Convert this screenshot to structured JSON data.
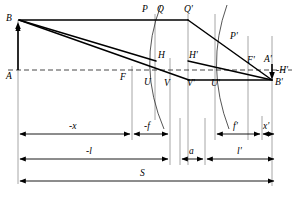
{
  "diagram": {
    "type": "optical-ray-diagram",
    "width": 297,
    "height": 197,
    "colors": {
      "ink": "#000000",
      "guide": "#8a8a8a",
      "axis": "#4d4d4d",
      "background": "#ffffff"
    },
    "axis": {
      "label": "optical-axis",
      "y": 70,
      "style": "dashed",
      "x_start": 8,
      "x_end": 292
    },
    "points": [
      {
        "id": "B",
        "label": "B",
        "x": 18,
        "y": 20,
        "lx": 6,
        "ly": 14
      },
      {
        "id": "A",
        "label": "A",
        "x": 18,
        "y": 70,
        "lx": 6,
        "ly": 72
      },
      {
        "id": "F",
        "label": "F",
        "x": 132,
        "y": 70,
        "lx": 122,
        "ly": 74
      },
      {
        "id": "P",
        "label": "P",
        "x": 148,
        "y": 20,
        "lx": 143,
        "ly": 7
      },
      {
        "id": "Q",
        "label": "Q",
        "x": 155,
        "y": 20,
        "lx": 158,
        "ly": 7
      },
      {
        "id": "Qp",
        "label": "Q'",
        "x": 188,
        "y": 20,
        "lx": 185,
        "ly": 7
      },
      {
        "id": "H",
        "label": "H",
        "x": 155,
        "y": 61,
        "lx": 157,
        "ly": 52
      },
      {
        "id": "Hp",
        "label": "H'",
        "x": 188,
        "y": 61,
        "lx": 188,
        "ly": 52
      },
      {
        "id": "U",
        "label": "U",
        "x": 152,
        "y": 77,
        "lx": 145,
        "ly": 79
      },
      {
        "id": "V",
        "label": "V",
        "x": 170,
        "y": 80,
        "lx": 165,
        "ly": 80
      },
      {
        "id": "Vp",
        "label": "V'",
        "x": 188,
        "y": 80,
        "lx": 188,
        "ly": 80
      },
      {
        "id": "Up",
        "label": "U'",
        "x": 215,
        "y": 80,
        "lx": 212,
        "ly": 80
      },
      {
        "id": "Pp",
        "label": "P'",
        "x": 228,
        "y": 40,
        "lx": 230,
        "ly": 33
      },
      {
        "id": "Fp",
        "label": "F'",
        "x": 248,
        "y": 70,
        "lx": 249,
        "ly": 58
      },
      {
        "id": "Ap",
        "label": "A'",
        "x": 272,
        "y": 70,
        "lx": 268,
        "ly": 57
      },
      {
        "id": "Bp",
        "label": "B'",
        "x": 272,
        "y": 80,
        "lx": 274,
        "ly": 80
      },
      {
        "id": "mHp",
        "label": "-H'",
        "x": 278,
        "y": 74,
        "lx": 276,
        "ly": 69
      }
    ],
    "dimensions": [
      {
        "id": "neg-x",
        "label": "-x",
        "row": 0,
        "x1": 18,
        "x2": 132,
        "y": 134,
        "lx": 71,
        "ly": 124
      },
      {
        "id": "neg-f",
        "label": "-f",
        "row": 0,
        "x1": 132,
        "x2": 170,
        "y": 134,
        "lx": 146,
        "ly": 124
      },
      {
        "id": "f-prime",
        "label": "f'",
        "row": 0,
        "x1": 215,
        "x2": 262,
        "y": 134,
        "lx": 234,
        "ly": 124
      },
      {
        "id": "x-prime",
        "label": "x'",
        "row": 0,
        "x1": 262,
        "x2": 276,
        "y": 134,
        "lx": 263,
        "ly": 124
      },
      {
        "id": "neg-l",
        "label": "-l",
        "row": 1,
        "x1": 18,
        "x2": 170,
        "y": 159,
        "lx": 88,
        "ly": 149
      },
      {
        "id": "a",
        "label": "a",
        "row": 1,
        "x1": 180,
        "x2": 205,
        "y": 159,
        "lx": 189,
        "ly": 149
      },
      {
        "id": "l-prime",
        "label": "l'",
        "row": 1,
        "x1": 205,
        "x2": 276,
        "y": 159,
        "lx": 238,
        "ly": 149
      },
      {
        "id": "S",
        "label": "S",
        "row": 2,
        "x1": 18,
        "x2": 276,
        "y": 181,
        "lx": 141,
        "ly": 171
      }
    ],
    "guide_lines": [
      {
        "id": "guide-A",
        "x": 18,
        "y1": 20,
        "y2": 184
      },
      {
        "id": "guide-F",
        "x": 132,
        "y1": 66,
        "y2": 140
      },
      {
        "id": "guide-HQ",
        "x": 155,
        "y1": 14,
        "y2": 120
      },
      {
        "id": "guide-V",
        "x": 170,
        "y1": 60,
        "y2": 165
      },
      {
        "id": "guide-HpQ",
        "x": 188,
        "y1": 14,
        "y2": 165
      },
      {
        "id": "guide-Up",
        "x": 215,
        "y1": 14,
        "y2": 140
      },
      {
        "id": "guide-Fp",
        "x": 248,
        "y1": 40,
        "y2": 140
      },
      {
        "id": "guide-Ap",
        "x": 272,
        "y1": 40,
        "y2": 186
      },
      {
        "id": "guide-xp",
        "x": 262,
        "y1": 118,
        "y2": 140
      },
      {
        "id": "guide-a1",
        "x": 180,
        "y1": 120,
        "y2": 165
      },
      {
        "id": "guide-a2",
        "x": 205,
        "y1": 120,
        "y2": 165
      }
    ],
    "rays": [
      {
        "id": "ray-parallel-in",
        "from": "B",
        "to": "P",
        "d": "M 18 20 L 188 20"
      },
      {
        "id": "ray-chief-in",
        "from": "B",
        "to": "H",
        "d": "M 18 20 L 155 61"
      },
      {
        "id": "ray-lower-in",
        "from": "B",
        "to": "V",
        "d": "M 18 20 L 188 80"
      },
      {
        "id": "ray-parallel-out",
        "from": "Qp",
        "to": "Bp",
        "d": "M 188 20 L 272 80"
      },
      {
        "id": "ray-chief-out",
        "from": "Hp",
        "to": "Bp",
        "d": "M 188 61 L 272 80"
      },
      {
        "id": "ray-lower-out",
        "from": "Vp",
        "to": "Bp",
        "d": "M 188 80 L 272 80"
      },
      {
        "id": "ray-focal-left",
        "from": "F",
        "to": "U",
        "d": "M 18 20 L 188 80"
      }
    ],
    "surfaces": [
      {
        "id": "surface-left",
        "d": "M 160 6 Q 136 66 163 128"
      },
      {
        "id": "surface-right",
        "d": "M 226 6 Q 204 66 228 128"
      }
    ],
    "objects": [
      {
        "id": "object-arrow",
        "label": "object B-A",
        "x": 18,
        "y_top": 22,
        "y_bottom": 70
      },
      {
        "id": "image-arrow",
        "label": "image A'-B'",
        "x": 272,
        "y_top": 64,
        "y_bottom": 80
      }
    ]
  }
}
